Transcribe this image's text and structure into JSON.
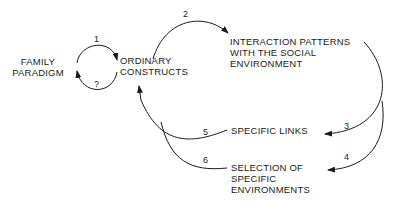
{
  "diagram": {
    "nodes": {
      "family_paradigm": [
        "FAMILY",
        "PARADIGM"
      ],
      "ordinary_constructs": [
        "ORDINARY",
        "CONSTRUCTS"
      ],
      "interaction_patterns": [
        "INTERACTION  PATTERNS",
        "WITH THE  SOCIAL",
        "ENVIRONMENT"
      ],
      "specific_links": [
        "SPECIFIC LINKS"
      ],
      "selection_environments": [
        "SELECTION OF",
        "SPECIFIC",
        "ENVIRONMENTS"
      ]
    },
    "edges": [
      {
        "label": "1",
        "from": "FAMILY PARADIGM",
        "to": "ORDINARY CONSTRUCTS"
      },
      {
        "label": "?",
        "from": "ORDINARY CONSTRUCTS",
        "to": "FAMILY PARADIGM"
      },
      {
        "label": "2",
        "from": "ORDINARY CONSTRUCTS",
        "to": "INTERACTION PATTERNS WITH THE SOCIAL ENVIRONMENT"
      },
      {
        "label": "3",
        "from": "INTERACTION PATTERNS WITH THE SOCIAL ENVIRONMENT",
        "to": "SPECIFIC LINKS"
      },
      {
        "label": "4",
        "from": "INTERACTION PATTERNS WITH THE SOCIAL ENVIRONMENT",
        "to": "SELECTION OF SPECIFIC ENVIRONMENTS"
      },
      {
        "label": "5",
        "from": "SPECIFIC LINKS",
        "to": "ORDINARY CONSTRUCTS"
      },
      {
        "label": "6",
        "from": "SELECTION OF SPECIFIC ENVIRONMENTS",
        "to": "ORDINARY CONSTRUCTS"
      }
    ],
    "line_color": "#1a1a1a"
  }
}
